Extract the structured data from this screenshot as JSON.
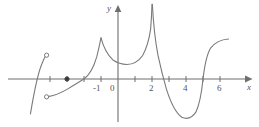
{
  "chart_data": {
    "type": "line",
    "title": "",
    "xlabel": "x",
    "ylabel": "y",
    "grid": false,
    "legend": null,
    "xlim": [
      -5.2,
      7.0
    ],
    "ylim": [
      -3.3,
      4.4
    ],
    "x_tick_values": [
      -4,
      -3,
      -2,
      -1,
      1,
      2,
      3,
      4,
      5,
      6
    ],
    "x_tick_labels": [
      "-1",
      "0",
      "2",
      "4",
      "6"
    ],
    "x_labeled_values": [
      -1,
      0,
      2,
      4,
      6
    ],
    "y_tick_values": [],
    "y_tick_labels": [],
    "annotations": [
      {
        "kind": "open-circle",
        "x": -4.2,
        "y": 1.4,
        "note": "left branch upper endpoint, excluded"
      },
      {
        "kind": "filled-dot",
        "x": -3.0,
        "y": 0.0,
        "note": "isolated defined value on x-axis"
      },
      {
        "kind": "open-circle",
        "x": -4.2,
        "y": -1.05,
        "note": "middle branch lower endpoint, excluded"
      }
    ],
    "features": [
      {
        "kind": "cusp",
        "x": -1,
        "y": 2.4
      },
      {
        "kind": "local-min",
        "x": 0.5,
        "y": 0.85
      },
      {
        "kind": "vertical-spike",
        "x": 2,
        "y": 4.4
      },
      {
        "kind": "local-min",
        "x": 4,
        "y": -2.3
      },
      {
        "kind": "x-intercept",
        "x": -2
      },
      {
        "kind": "x-intercept",
        "x": 2.65
      },
      {
        "kind": "x-intercept",
        "x": 5
      }
    ],
    "series": [
      {
        "name": "left-branch",
        "path": "M -5.15 -2.05 C -4.95 -0.85, -4.75 0.30, -4.45 0.95 C -4.36 1.18, -4.28 1.33, -4.22 1.40"
      },
      {
        "name": "middle-branch",
        "path": "M -4.18 -1.05 C -3.85 -1.00, -3.40 -0.85, -2.95 -0.58 C -2.55 -0.34, -2.25 -0.15, -2.00 0.00 C -1.70 0.22, -1.45 0.62, -1.25 1.30 C -1.14 1.75, -1.06 2.12, -1.00 2.42"
      },
      {
        "name": "main-branch",
        "path": "M -1.00 2.42 C -0.84 1.82, -0.62 1.42, -0.30 1.12 C 0.00 0.92, 0.28 0.86, 0.52 0.85 C 0.90 0.86, 1.20 1.02, 1.45 1.38 C 1.68 1.80, 1.82 2.25, 1.92 2.95 C 1.97 3.55, 1.99 4.05, 2.00 4.40"
      },
      {
        "name": "descending-branch",
        "path": "M 2.02 4.40 C 2.08 3.30, 2.18 2.30, 2.35 1.40 C 2.50 0.70, 2.66 0.05, 2.85 -0.60 C 3.10 -1.40, 3.40 -2.00, 3.75 -2.25 C 4.05 -2.38, 4.35 -2.30, 4.58 -1.95 C 4.80 -1.50, 4.92 -0.80, 5.00 0.00 C 5.10 0.85, 5.22 1.45, 5.45 1.82 C 5.75 2.20, 6.10 2.32, 6.50 2.35"
      }
    ]
  },
  "axes": {
    "x_axis_label": "x",
    "y_axis_label": "y",
    "origin_label": "0",
    "tick_label_neg_one": "-1",
    "tick_label_two": "2",
    "tick_label_four": "4",
    "tick_label_six": "6"
  },
  "style": {
    "curve_color": "#7a7a7a",
    "axis_color": "#6e6e6e",
    "label_color": "#555555",
    "background": "#ffffff"
  }
}
